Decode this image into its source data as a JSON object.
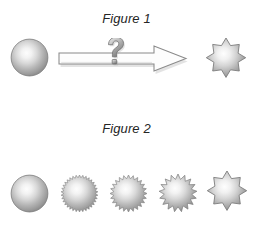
{
  "document": {
    "background_color": "#ffffff",
    "width": 253,
    "height": 228
  },
  "palette": {
    "shape_highlight": "#f7f7f7",
    "shape_midtone": "#c9c9c9",
    "shape_edge": "#8e8e8e",
    "shape_outline": "#6e6e6e",
    "arrow_fill": "#fdfdfd",
    "arrow_outline": "#8a8a8a",
    "arrow_shadow": "#bdbdbd",
    "question_mark_light": "#e8e8e8",
    "question_mark_dark": "#7a7a7a",
    "caption_color": "#252525"
  },
  "figures": [
    {
      "id": "figure-1",
      "caption": "Figure 1",
      "caption_style": "italic",
      "description": "A shaded sphere transforms, via an arrow marked with a question mark, into a ten-pointed star burst.",
      "elements": [
        {
          "name": "sphere",
          "shape": "sphere",
          "cx": 29.5,
          "cy": 57.5,
          "radius": 18.5,
          "points": 0
        },
        {
          "name": "transformation-arrow",
          "shape": "block-arrow",
          "direction": "right",
          "x": 58,
          "y": 38,
          "width": 136,
          "height": 40,
          "marker": "question-mark"
        },
        {
          "name": "star-burst",
          "shape": "star",
          "cx": 225,
          "cy": 59,
          "outer_radius": 21,
          "inner_radius": 14.5,
          "points": 10
        }
      ]
    },
    {
      "id": "figure-2",
      "caption": "Figure 2",
      "caption_style": "italic",
      "description": "A five-step morph sequence from a smooth sphere to a ten-pointed star, with progressively fewer and larger points.",
      "sequence": [
        {
          "name": "morph-step-1",
          "label": "sphere",
          "shape": "sphere",
          "cx": 29.5,
          "cy": 193,
          "outer_radius": 18.5,
          "inner_radius": 18.5,
          "points": 0
        },
        {
          "name": "morph-step-2",
          "label": "fine-serrated",
          "shape": "star",
          "cx": 79,
          "cy": 193,
          "outer_radius": 18.5,
          "inner_radius": 15.8,
          "points": 34
        },
        {
          "name": "morph-step-3",
          "label": "medium-serrated",
          "shape": "star",
          "cx": 128.5,
          "cy": 193,
          "outer_radius": 18.5,
          "inner_radius": 14.8,
          "points": 24
        },
        {
          "name": "morph-step-4",
          "label": "coarse-serrated",
          "shape": "star",
          "cx": 177.5,
          "cy": 193,
          "outer_radius": 19,
          "inner_radius": 13.8,
          "points": 17
        },
        {
          "name": "morph-step-5",
          "label": "ten-point-star",
          "shape": "star",
          "cx": 226,
          "cy": 192,
          "outer_radius": 21,
          "inner_radius": 14.5,
          "points": 10
        }
      ]
    }
  ]
}
